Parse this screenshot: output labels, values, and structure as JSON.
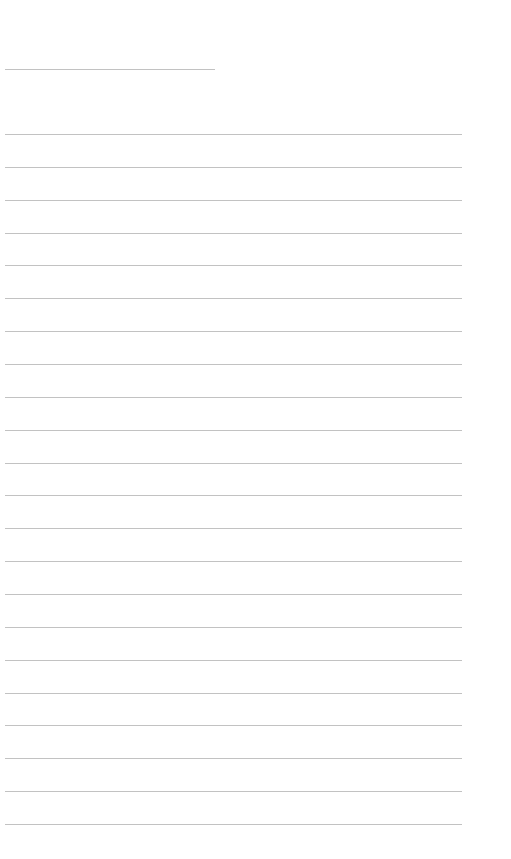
{
  "page": {
    "type": "lined-paper",
    "background": "#ffffff",
    "line_color": "#c2c2c2",
    "header_rule": {
      "x": 5,
      "y": 69,
      "width": 210
    },
    "writing_lines": {
      "count": 22,
      "x": 5,
      "width": 457,
      "first_y": 134,
      "spacing": 32.86
    },
    "text": ""
  }
}
